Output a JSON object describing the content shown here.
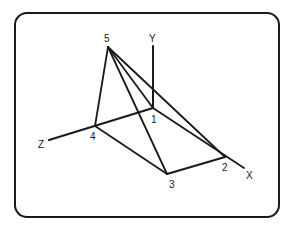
{
  "diagram": {
    "type": "3d-wireframe-pyramid",
    "axes": {
      "x": {
        "label": "X"
      },
      "y": {
        "label": "Y"
      },
      "z": {
        "label": "Z"
      }
    },
    "vertices": [
      {
        "id": "1",
        "label": "1"
      },
      {
        "id": "2",
        "label": "2"
      },
      {
        "id": "3",
        "label": "3"
      },
      {
        "id": "4",
        "label": "4"
      },
      {
        "id": "5",
        "label": "5"
      }
    ],
    "edges": [
      [
        "1",
        "2"
      ],
      [
        "2",
        "3"
      ],
      [
        "3",
        "4"
      ],
      [
        "4",
        "1"
      ],
      [
        "5",
        "1"
      ],
      [
        "5",
        "2"
      ],
      [
        "5",
        "3"
      ],
      [
        "5",
        "4"
      ]
    ],
    "colors": {
      "line": "#1a1a1a",
      "background": "#ffffff"
    }
  }
}
